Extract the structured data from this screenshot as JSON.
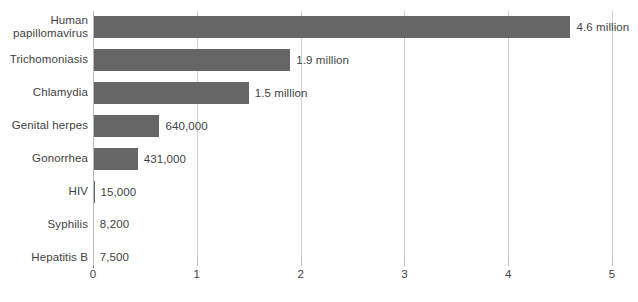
{
  "chart_data": {
    "type": "bar",
    "orientation": "horizontal",
    "title": "",
    "subtitle": "",
    "xlabel": "",
    "ylabel": "",
    "xlim": [
      0,
      5
    ],
    "ylim": null,
    "grid": true,
    "legend": false,
    "legend_position": "none",
    "units": "millions",
    "bar_color": "#666666",
    "gridline_color": "#d2d2d2",
    "text_color": "#3f3f3f",
    "categories": [
      "Human papillomavirus",
      "Trichomoniasis",
      "Chlamydia",
      "Genital herpes",
      "Gonorrhea",
      "HIV",
      "Syphilis",
      "Hepatitis B"
    ],
    "values": [
      4.6,
      1.9,
      1.5,
      0.64,
      0.431,
      0.015,
      0.0082,
      0.0075
    ],
    "value_labels": [
      "4.6 million",
      "1.9 million",
      "1.5 million",
      "640,000",
      "431,000",
      "15,000",
      "8,200",
      "7,500"
    ],
    "xticks": [
      0,
      1,
      2,
      3,
      4,
      5
    ],
    "xtick_labels": [
      "0",
      "1",
      "2",
      "3",
      "4",
      "5"
    ]
  }
}
